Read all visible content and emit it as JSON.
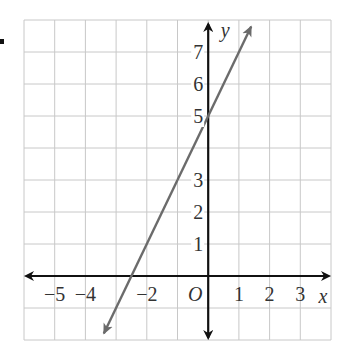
{
  "chart_data": {
    "type": "line",
    "title": "",
    "xlabel": "x",
    "ylabel": "y",
    "origin_label": "O",
    "xlim": [
      -6,
      4
    ],
    "ylim": [
      -2,
      8
    ],
    "grid": true,
    "x_tick_labels": [
      "−5",
      "−4",
      "−2",
      "1",
      "2",
      "3"
    ],
    "x_tick_values": [
      -5,
      -4,
      -2,
      1,
      2,
      3
    ],
    "y_tick_labels": [
      "7",
      "6",
      "5",
      "3",
      "2",
      "1"
    ],
    "y_tick_values": [
      7,
      6,
      5,
      3,
      2,
      1
    ],
    "series": [
      {
        "name": "line",
        "equation": "y = 2x + 5",
        "slope": 2,
        "intercept": 5,
        "x": [
          -3.4,
          -2.5,
          0,
          1.4
        ],
        "y": [
          -1.8,
          0,
          5,
          7.8
        ],
        "arrows": "both",
        "color": "#6b6b6b"
      }
    ]
  },
  "colors": {
    "grid": "#c8c8c8",
    "axis": "#111111",
    "line": "#6b6b6b",
    "text": "#333333"
  }
}
